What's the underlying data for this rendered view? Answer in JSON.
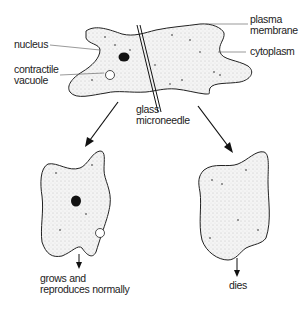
{
  "diagram": {
    "labels": {
      "plasma_membrane": [
        "plasma",
        "membrane"
      ],
      "nucleus": "nucleus",
      "cytoplasm": "cytoplasm",
      "contractile_vacuole": [
        "contractile",
        "vacuole"
      ],
      "glass_microneedle": [
        "glass",
        "microneedle"
      ],
      "outcome_left": [
        "grows and",
        "reproduces normally"
      ],
      "outcome_right": "dies"
    },
    "colors": {
      "stroke": "#222222",
      "fill": "#f2f2f2",
      "nucleus": "#111111"
    }
  }
}
